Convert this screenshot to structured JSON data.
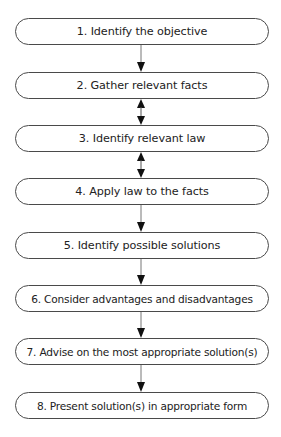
{
  "diagram": {
    "type": "vertical-flowchart",
    "steps": [
      {
        "number": 1,
        "label": "1. Identify the objective"
      },
      {
        "number": 2,
        "label": "2. Gather relevant facts"
      },
      {
        "number": 3,
        "label": "3. Identify relevant law"
      },
      {
        "number": 4,
        "label": "4. Apply law to the facts"
      },
      {
        "number": 5,
        "label": "5. Identify possible solutions"
      },
      {
        "number": 6,
        "label": "6. Consider advantages and disadvantages"
      },
      {
        "number": 7,
        "label": "7. Advise on the most appropriate solution(s)"
      },
      {
        "number": 8,
        "label": "8. Present solution(s) in appropriate form"
      }
    ],
    "connectors": [
      {
        "from": 1,
        "to": 2,
        "direction": "down"
      },
      {
        "from": 2,
        "to": 3,
        "direction": "both"
      },
      {
        "from": 3,
        "to": 4,
        "direction": "both"
      },
      {
        "from": 4,
        "to": 5,
        "direction": "down"
      },
      {
        "from": 5,
        "to": 6,
        "direction": "down"
      },
      {
        "from": 6,
        "to": 7,
        "direction": "down"
      },
      {
        "from": 7,
        "to": 8,
        "direction": "down"
      }
    ],
    "colors": {
      "stroke": "#4a4a4a",
      "arrow": "#111111",
      "text": "#222222",
      "background": "#ffffff"
    }
  }
}
